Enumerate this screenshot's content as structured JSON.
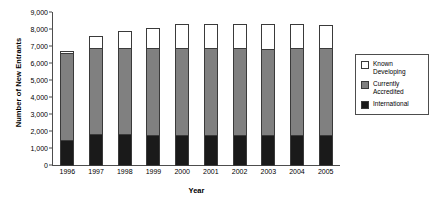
{
  "chart_data": {
    "type": "bar",
    "subtype": "stacked-bar",
    "title": "",
    "xlabel": "Year",
    "ylabel": "Number of New Entrants",
    "categories": [
      "1996",
      "1997",
      "1998",
      "1999",
      "2000",
      "2001",
      "2002",
      "2003",
      "2004",
      "2005"
    ],
    "series": [
      {
        "name": "International",
        "color": "#1a1a1a",
        "values": [
          1550,
          1880,
          1880,
          1850,
          1830,
          1820,
          1820,
          1830,
          1820,
          1820
        ]
      },
      {
        "name": "Currently Accredited",
        "color": "#808080",
        "values": [
          5150,
          5120,
          5120,
          5150,
          5170,
          5180,
          5180,
          5120,
          5180,
          5180
        ]
      },
      {
        "name": "Known Developing",
        "color": "#ffffff",
        "values": [
          200,
          750,
          1050,
          1250,
          1450,
          1450,
          1450,
          1500,
          1450,
          1440
        ]
      }
    ],
    "totals": [
      6900,
      7750,
      8050,
      8250,
      8450,
      8450,
      8450,
      8450,
      8450,
      8440
    ],
    "ylim": [
      0,
      9000
    ],
    "ytick_values": [
      0,
      1000,
      2000,
      3000,
      4000,
      5000,
      6000,
      7000,
      8000,
      9000
    ],
    "ytick_labels": [
      "0",
      "1,000",
      "2,000",
      "3,000",
      "4,000",
      "5,000",
      "6,000",
      "7,000",
      "8,000",
      "9,000"
    ],
    "grid": false,
    "legend_position": "right",
    "legend_entries": [
      {
        "label": "Known\nDeveloping",
        "color": "#ffffff"
      },
      {
        "label": "Currently\nAccredited",
        "color": "#808080"
      },
      {
        "label": "International",
        "color": "#1a1a1a"
      }
    ]
  }
}
